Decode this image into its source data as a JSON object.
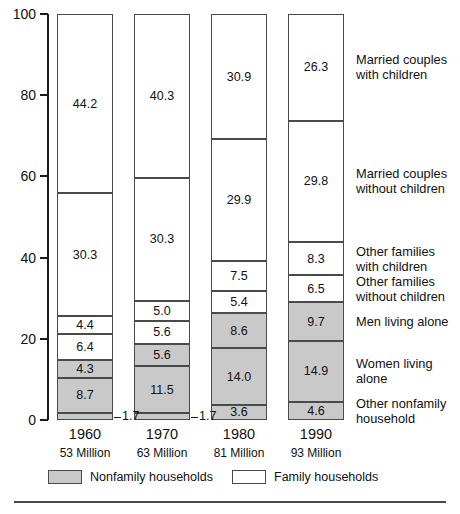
{
  "chart_data": {
    "type": "bar",
    "title": "",
    "subtitle": "",
    "xlabel": "",
    "ylabel": "",
    "ylim": [
      0,
      100
    ],
    "yticks": [
      "0",
      "20",
      "40",
      "60",
      "80",
      "100"
    ],
    "grid": false,
    "stacked": true,
    "legend_position": "right",
    "categories": [
      "1960",
      "1970",
      "1980",
      "1990"
    ],
    "category_sublabels": [
      "53 Million",
      "63 Million",
      "81 Million",
      "93 Million"
    ],
    "series": [
      {
        "name": "Married couples with children",
        "group": "Family households",
        "fill": "white",
        "values": [
          44.2,
          40.3,
          30.9,
          26.3
        ]
      },
      {
        "name": "Married couples without children",
        "group": "Family households",
        "fill": "white",
        "values": [
          30.3,
          30.3,
          29.9,
          29.8
        ]
      },
      {
        "name": "Other families with children",
        "group": "Family households",
        "fill": "white",
        "values": [
          4.4,
          5.0,
          7.5,
          8.3
        ]
      },
      {
        "name": "Other families without children",
        "group": "Family households",
        "fill": "white",
        "values": [
          6.4,
          5.6,
          5.4,
          6.5
        ]
      },
      {
        "name": "Men living alone",
        "group": "Nonfamily households",
        "fill": "gray",
        "values": [
          4.3,
          5.6,
          8.6,
          9.7
        ]
      },
      {
        "name": "Women living alone",
        "group": "Nonfamily households",
        "fill": "gray",
        "values": [
          8.7,
          11.5,
          14.0,
          14.9
        ]
      },
      {
        "name": "Other nonfamily household",
        "group": "Nonfamily households",
        "fill": "gray",
        "values": [
          1.7,
          1.7,
          3.6,
          4.6
        ]
      }
    ],
    "value_labels": {
      "1960": [
        "44.2",
        "30.3",
        "4.4",
        "6.4",
        "4.3",
        "8.7",
        "1.7"
      ],
      "1970": [
        "40.3",
        "30.3",
        "5.0",
        "5.6",
        "5.6",
        "11.5",
        "1.7"
      ],
      "1980": [
        "30.9",
        "29.9",
        "7.5",
        "5.4",
        "8.6",
        "14.0",
        "3.6"
      ],
      "1990": [
        "26.3",
        "29.8",
        "8.3",
        "6.5",
        "9.7",
        "14.9",
        "4.6"
      ]
    },
    "callouts": [
      {
        "text": "1.7",
        "category": "1960"
      },
      {
        "text": "1.7",
        "category": "1970"
      }
    ],
    "colors": {
      "nonfamily_fill": "#c9c9c9",
      "family_fill": "#ffffff",
      "outline": "#4a4a4a",
      "axis": "#1a1a1a",
      "text": "#111111"
    }
  },
  "category_labels": [
    "Married couples with children",
    "Married couples without children",
    "Other families with children",
    "Other families without children",
    "Men living alone",
    "Women living alone",
    "Other nonfamily household"
  ],
  "key": {
    "nonfamily_label": "Nonfamily households",
    "family_label": "Family households"
  }
}
